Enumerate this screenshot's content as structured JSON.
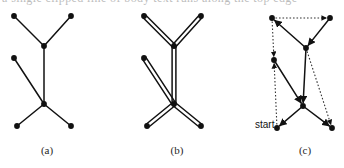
{
  "figure": {
    "top_text_sliver": "a single clipped line of body text runs along the top edge",
    "background_color": "#ffffff",
    "ink_color": "#111111",
    "dotted_color": "#333333",
    "panels": [
      {
        "id": "a",
        "caption": "(a)",
        "type": "undirected-tree",
        "origin_x": 0,
        "description": "spanning tree with seven vertices and six solid edges",
        "nodes": [
          {
            "id": "tl",
            "name": "top-left-node",
            "x": 14,
            "y": 16
          },
          {
            "id": "tr",
            "name": "top-right-node",
            "x": 71,
            "y": 16
          },
          {
            "id": "uj",
            "name": "upper-junction-node",
            "x": 44,
            "y": 46
          },
          {
            "id": "ml",
            "name": "mid-left-node",
            "x": 14,
            "y": 58
          },
          {
            "id": "lj",
            "name": "lower-junction-node",
            "x": 44,
            "y": 104
          },
          {
            "id": "bl",
            "name": "bottom-left-node",
            "x": 17,
            "y": 126
          },
          {
            "id": "br",
            "name": "bottom-right-node",
            "x": 71,
            "y": 126
          }
        ],
        "edges": [
          {
            "from": "tl",
            "to": "uj",
            "style": "solid"
          },
          {
            "from": "tr",
            "to": "uj",
            "style": "solid"
          },
          {
            "from": "uj",
            "to": "lj",
            "style": "solid"
          },
          {
            "from": "ml",
            "to": "lj",
            "style": "solid"
          },
          {
            "from": "lj",
            "to": "bl",
            "style": "solid"
          },
          {
            "from": "lj",
            "to": "br",
            "style": "solid"
          }
        ]
      },
      {
        "id": "b",
        "caption": "(b)",
        "type": "doubled-edge-multigraph",
        "origin_x": 130,
        "description": "same tree with every edge duplicated into a parallel pair",
        "nodes": [
          {
            "id": "tl",
            "name": "top-left-node",
            "x": 144,
            "y": 16
          },
          {
            "id": "tr",
            "name": "top-right-node",
            "x": 201,
            "y": 16
          },
          {
            "id": "uj",
            "name": "upper-junction-node",
            "x": 174,
            "y": 46
          },
          {
            "id": "ml",
            "name": "mid-left-node",
            "x": 144,
            "y": 58
          },
          {
            "id": "lj",
            "name": "lower-junction-node",
            "x": 174,
            "y": 104
          },
          {
            "id": "bl",
            "name": "bottom-left-node",
            "x": 147,
            "y": 126
          },
          {
            "id": "br",
            "name": "bottom-right-node",
            "x": 201,
            "y": 126
          }
        ],
        "edges": [
          {
            "from": "tl",
            "to": "uj",
            "style": "double"
          },
          {
            "from": "tr",
            "to": "uj",
            "style": "double"
          },
          {
            "from": "uj",
            "to": "lj",
            "style": "double"
          },
          {
            "from": "ml",
            "to": "lj",
            "style": "double"
          },
          {
            "from": "lj",
            "to": "bl",
            "style": "double"
          },
          {
            "from": "lj",
            "to": "br",
            "style": "double"
          }
        ]
      },
      {
        "id": "c",
        "caption": "(c)",
        "type": "directed-euler-tour",
        "origin_x": 258,
        "start_label": "start",
        "start_node": "bl",
        "description": "euler tour: solid arrows for tree edges, dotted arrows for the return legs",
        "nodes": [
          {
            "id": "tl",
            "name": "top-left-node",
            "x": 272,
            "y": 18
          },
          {
            "id": "tr",
            "name": "top-right-node",
            "x": 330,
            "y": 18
          },
          {
            "id": "uj",
            "name": "upper-junction-node",
            "x": 306,
            "y": 48
          },
          {
            "id": "ml",
            "name": "mid-left-node",
            "x": 274,
            "y": 60
          },
          {
            "id": "lj",
            "name": "lower-junction-node",
            "x": 303,
            "y": 106
          },
          {
            "id": "bl",
            "name": "bottom-left-node",
            "x": 277,
            "y": 128
          },
          {
            "id": "br",
            "name": "bottom-right-node",
            "x": 332,
            "y": 128
          }
        ],
        "edges": [
          {
            "from": "uj",
            "to": "tl",
            "style": "solid",
            "arrow": true
          },
          {
            "from": "tl",
            "to": "tr",
            "style": "dotted",
            "arrow": true
          },
          {
            "from": "tr",
            "to": "uj",
            "style": "solid",
            "arrow": true
          },
          {
            "from": "uj",
            "to": "lj",
            "style": "solid",
            "arrow": true
          },
          {
            "from": "tl",
            "to": "ml",
            "style": "dotted",
            "arrow": true
          },
          {
            "from": "ml",
            "to": "lj",
            "style": "solid",
            "arrow": true
          },
          {
            "from": "lj",
            "to": "bl",
            "style": "solid",
            "arrow": true
          },
          {
            "from": "lj",
            "to": "br",
            "style": "solid",
            "arrow": true
          },
          {
            "from": "uj",
            "to": "br",
            "style": "dotted",
            "arrow": true
          },
          {
            "from": "bl",
            "to": "ml",
            "style": "dotted",
            "arrow": true
          }
        ]
      }
    ]
  }
}
